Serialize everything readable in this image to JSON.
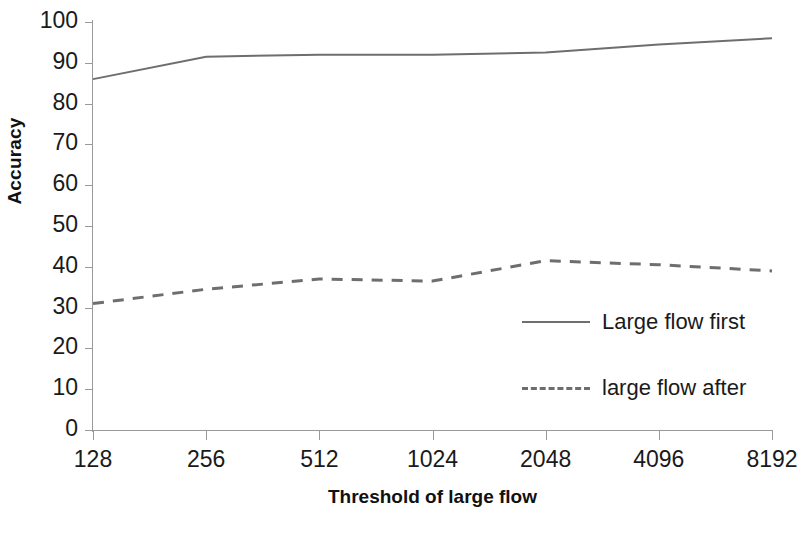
{
  "chart_data": {
    "type": "line",
    "title": "",
    "xlabel": "Threshold of large flow",
    "ylabel": "Accuracy",
    "categories": [
      "128",
      "256",
      "512",
      "1024",
      "2048",
      "4096",
      "8192"
    ],
    "x": [
      128,
      256,
      512,
      1024,
      2048,
      4096,
      8192
    ],
    "ylim": [
      0,
      100
    ],
    "y_ticks": [
      100,
      90,
      80,
      70,
      60,
      50,
      40,
      30,
      20,
      10,
      0
    ],
    "grid": false,
    "legend_position": "inside-right",
    "series": [
      {
        "name": "Large flow first",
        "style": "solid",
        "color": "#6e6e6e",
        "values": [
          86,
          91.5,
          92,
          92,
          92.5,
          94.5,
          96
        ]
      },
      {
        "name": "large flow after",
        "style": "dashed",
        "color": "#6e6e6e",
        "values": [
          31,
          34.5,
          37,
          36.5,
          41.5,
          40.5,
          39
        ]
      }
    ]
  },
  "axes": {
    "y_title": "Accuracy",
    "x_title": "Threshold of large flow",
    "y_tick_labels": [
      "100",
      "90",
      "80",
      "70",
      "60",
      "50",
      "40",
      "30",
      "20",
      "10",
      "0"
    ],
    "x_tick_labels": [
      "128",
      "256",
      "512",
      "1024",
      "2048",
      "4096",
      "8192"
    ]
  },
  "legend": {
    "items": [
      {
        "label": "Large flow first",
        "style": "solid"
      },
      {
        "label": "large flow after",
        "style": "dashed"
      }
    ]
  },
  "colors": {
    "background": "#ffffff",
    "axis": "#9a9a9a",
    "series": "#6e6e6e",
    "text": "#1a1a1a"
  }
}
